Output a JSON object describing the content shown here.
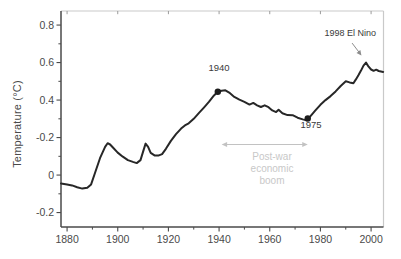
{
  "figure": {
    "width_px": 401,
    "height_px": 259,
    "background": "#ffffff"
  },
  "chart_data": {
    "type": "line",
    "title": "",
    "xlabel": "",
    "ylabel": "Temperature (°C)",
    "xlim": [
      1877.6,
      2004.9
    ],
    "ylim": [
      -0.277,
      0.875
    ],
    "grid": false,
    "legend": false,
    "xticks": {
      "values": [
        1880,
        1900,
        1920,
        1940,
        1960,
        1980,
        2000
      ],
      "labels": [
        "1880",
        "1900",
        "1920",
        "1940",
        "1960",
        "1980",
        "2000"
      ],
      "minor_values": [
        1890,
        1910,
        1930,
        1950,
        1970,
        1990
      ]
    },
    "yticks": {
      "values": [
        0.8,
        0.6,
        0.4,
        0.2,
        0,
        -0.2
      ],
      "labels": [
        "0.8",
        "0.6",
        "0.4",
        "-0.2",
        "0",
        "-0.2"
      ],
      "minor_values": [
        0.7,
        0.5,
        0.3,
        0.1,
        -0.1
      ]
    },
    "series": [
      {
        "name": "global-temperature-anomaly",
        "color": "#272727",
        "points": [
          [
            1877.6,
            -0.045
          ],
          [
            1880,
            -0.05
          ],
          [
            1882,
            -0.055
          ],
          [
            1884,
            -0.065
          ],
          [
            1886,
            -0.072
          ],
          [
            1888,
            -0.068
          ],
          [
            1889.5,
            -0.05
          ],
          [
            1891,
            0.01
          ],
          [
            1893,
            0.09
          ],
          [
            1895,
            0.15
          ],
          [
            1896,
            0.17
          ],
          [
            1897,
            0.163
          ],
          [
            1898,
            0.148
          ],
          [
            1900,
            0.12
          ],
          [
            1902,
            0.098
          ],
          [
            1904,
            0.08
          ],
          [
            1906,
            0.07
          ],
          [
            1907.5,
            0.064
          ],
          [
            1909,
            0.08
          ],
          [
            1910,
            0.125
          ],
          [
            1911,
            0.168
          ],
          [
            1912,
            0.15
          ],
          [
            1913,
            0.118
          ],
          [
            1914.5,
            0.105
          ],
          [
            1916,
            0.104
          ],
          [
            1917.5,
            0.112
          ],
          [
            1919,
            0.14
          ],
          [
            1921,
            0.182
          ],
          [
            1923,
            0.218
          ],
          [
            1925,
            0.248
          ],
          [
            1926.5,
            0.265
          ],
          [
            1928,
            0.276
          ],
          [
            1930,
            0.3
          ],
          [
            1932,
            0.33
          ],
          [
            1934,
            0.36
          ],
          [
            1936,
            0.39
          ],
          [
            1938,
            0.425
          ],
          [
            1939.5,
            0.444
          ],
          [
            1941,
            0.45
          ],
          [
            1942.5,
            0.452
          ],
          [
            1944,
            0.44
          ],
          [
            1946,
            0.417
          ],
          [
            1948,
            0.402
          ],
          [
            1950,
            0.39
          ],
          [
            1952,
            0.376
          ],
          [
            1953.5,
            0.385
          ],
          [
            1955,
            0.372
          ],
          [
            1956.5,
            0.363
          ],
          [
            1958,
            0.372
          ],
          [
            1959.5,
            0.362
          ],
          [
            1961,
            0.345
          ],
          [
            1962.5,
            0.336
          ],
          [
            1963.5,
            0.348
          ],
          [
            1965,
            0.33
          ],
          [
            1967,
            0.32
          ],
          [
            1969,
            0.319
          ],
          [
            1971,
            0.306
          ],
          [
            1973,
            0.297
          ],
          [
            1974.5,
            0.292
          ],
          [
            1976,
            0.313
          ],
          [
            1978,
            0.345
          ],
          [
            1980,
            0.375
          ],
          [
            1982,
            0.4
          ],
          [
            1984,
            0.421
          ],
          [
            1986,
            0.446
          ],
          [
            1988,
            0.475
          ],
          [
            1990,
            0.5
          ],
          [
            1991.5,
            0.494
          ],
          [
            1993,
            0.49
          ],
          [
            1994,
            0.51
          ],
          [
            1995,
            0.532
          ],
          [
            1996,
            0.557
          ],
          [
            1997,
            0.584
          ],
          [
            1998,
            0.6
          ],
          [
            1999,
            0.578
          ],
          [
            2000,
            0.563
          ],
          [
            2001,
            0.556
          ],
          [
            2002,
            0.562
          ],
          [
            2003,
            0.555
          ],
          [
            2004.8,
            0.55
          ]
        ]
      }
    ],
    "markers": [
      {
        "label": "1940",
        "year": 1939.5,
        "value": 0.444
      },
      {
        "label": "1975",
        "year": 1975,
        "value": 0.302
      }
    ],
    "annotations": {
      "year1940": {
        "text": "1940",
        "color": "#3a3a3a"
      },
      "year1975": {
        "text": "1975",
        "color": "#3a3a3a"
      },
      "elnino": {
        "text": "1998 El Nino",
        "color": "#3a3a3a",
        "arrow_color": "#8c8c8c",
        "arrow_from": [
          1992.5,
          0.704
        ],
        "arrow_to": [
          1996.2,
          0.638
        ]
      },
      "postwar": {
        "lines": [
          "Post-war",
          "economic",
          "boom"
        ],
        "color": "#c8c8c8",
        "span_arrow": {
          "from_year": 1941,
          "to_year": 1975,
          "at_value": 0.163,
          "color": "#c2c2c2"
        }
      }
    },
    "colors": {
      "curve": "#272727",
      "marker": "#1c1c1c",
      "axis_dark": "#4a4a4a",
      "axis_light": "#c9c9c9",
      "top_tick": "#9b9b9b",
      "tick_label": "#4a4a4a"
    }
  }
}
